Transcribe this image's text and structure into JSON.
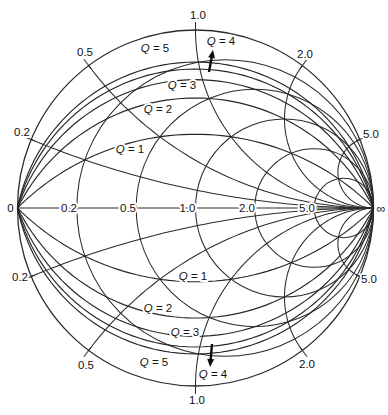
{
  "figure": {
    "background_color": "#ffffff",
    "line_color": "#2b2b2b",
    "text_color": "#111111"
  },
  "chart_data": {
    "type": "smith_chart",
    "axis_labels": [
      "0",
      "0.2",
      "0.5",
      "1.0",
      "2.0",
      "5.0",
      "∞"
    ],
    "rim_labels": {
      "top": "1.0",
      "upper_left": "0.5",
      "upper_right": "2.0",
      "left_upper": "0.2",
      "right_upper": "5.0",
      "left_lower": "0.2",
      "right_lower": "5.0",
      "lower_left": "0.5",
      "lower_right": "2.0",
      "bottom": "1.0"
    },
    "grid": {
      "normalized_resistance_circles": [
        0.2,
        0.5,
        1.0,
        2.0,
        5.0
      ],
      "normalized_reactance_arcs": [
        0.2,
        0.5,
        1.0,
        2.0,
        5.0
      ],
      "axis_range_labels": {
        "left": "0",
        "right": "∞"
      },
      "mirrored_lower_half": true
    },
    "q_contours": {
      "values": [
        1,
        2,
        3,
        4,
        5
      ],
      "labels": [
        "Q = 1",
        "Q = 2",
        "Q = 3",
        "Q = 4",
        "Q = 5"
      ],
      "drawn_in_both_halves": true
    },
    "annotations": [
      {
        "label": "Q = 4",
        "direction": "up",
        "half": "upper"
      },
      {
        "label": "Q = 4",
        "direction": "down",
        "half": "lower"
      }
    ]
  }
}
